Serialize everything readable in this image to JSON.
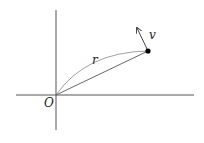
{
  "diagram": {
    "colors": {
      "axis": "#555555",
      "line": "#555555",
      "arc": "#777777",
      "point": "#000000",
      "text": "#222222"
    },
    "axes": {
      "x_axis": {
        "x1": 16,
        "y1": 95,
        "x2": 194,
        "y2": 95
      },
      "y_axis": {
        "x1": 56,
        "y1": 10,
        "x2": 56,
        "y2": 130
      }
    },
    "origin": {
      "label": "O",
      "x": 56,
      "y": 95
    },
    "point": {
      "x": 148,
      "y": 51,
      "radius": 2.6
    },
    "position_vector": {
      "label": "r"
    },
    "trajectory": {
      "description": "curved path from O to point"
    },
    "velocity_vector": {
      "label": "v",
      "x1": 148,
      "y1": 51,
      "x2": 137,
      "y2": 28
    }
  }
}
